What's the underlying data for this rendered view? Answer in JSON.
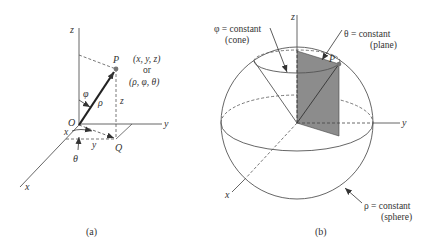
{
  "figure": {
    "panel_a": {
      "caption": "(a)",
      "axis_labels": {
        "z": "z",
        "y": "y",
        "x": "x"
      },
      "point_P": "P",
      "point_Q": "Q",
      "origin": "O",
      "cartesian_coords": "(x, y, z)",
      "or_text": "or",
      "spherical_coords": "(ρ, φ, θ)",
      "angle_phi": "φ",
      "radius_rho": "ρ",
      "height_z": "z",
      "proj_x": "x",
      "proj_y": "y",
      "angle_theta": "θ"
    },
    "panel_b": {
      "caption": "(b)",
      "axis_labels": {
        "z": "z",
        "y": "y",
        "x": "x"
      },
      "point_P": "P",
      "phi_label": "φ = constant",
      "phi_sub": "(cone)",
      "theta_label": "θ = constant",
      "theta_sub": "(plane)",
      "rho_label": "ρ = constant",
      "rho_sub": "(sphere)"
    },
    "colors": {
      "line": "#444444",
      "plane_fill": "#8c8c8c",
      "point": "#777777",
      "text": "#333333"
    }
  }
}
